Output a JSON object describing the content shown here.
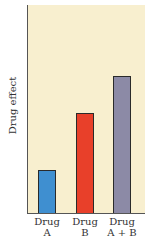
{
  "chart_data": {
    "type": "bar",
    "title": "",
    "xlabel": "",
    "ylabel": "Drug effect",
    "categories": [
      "Drug A",
      "Drug B",
      "Drug A + B"
    ],
    "category_lines": [
      [
        "Drug",
        "A"
      ],
      [
        "Drug",
        "B"
      ],
      [
        "Drug",
        "A + B"
      ]
    ],
    "values": [
      43,
      100,
      138
    ],
    "ylim": [
      0,
      209
    ],
    "colors": [
      "#3f8fd0",
      "#e8402a",
      "#8c8aa6"
    ],
    "background": "#f8efcf",
    "grid": false,
    "legend": null,
    "y_ticks": []
  }
}
